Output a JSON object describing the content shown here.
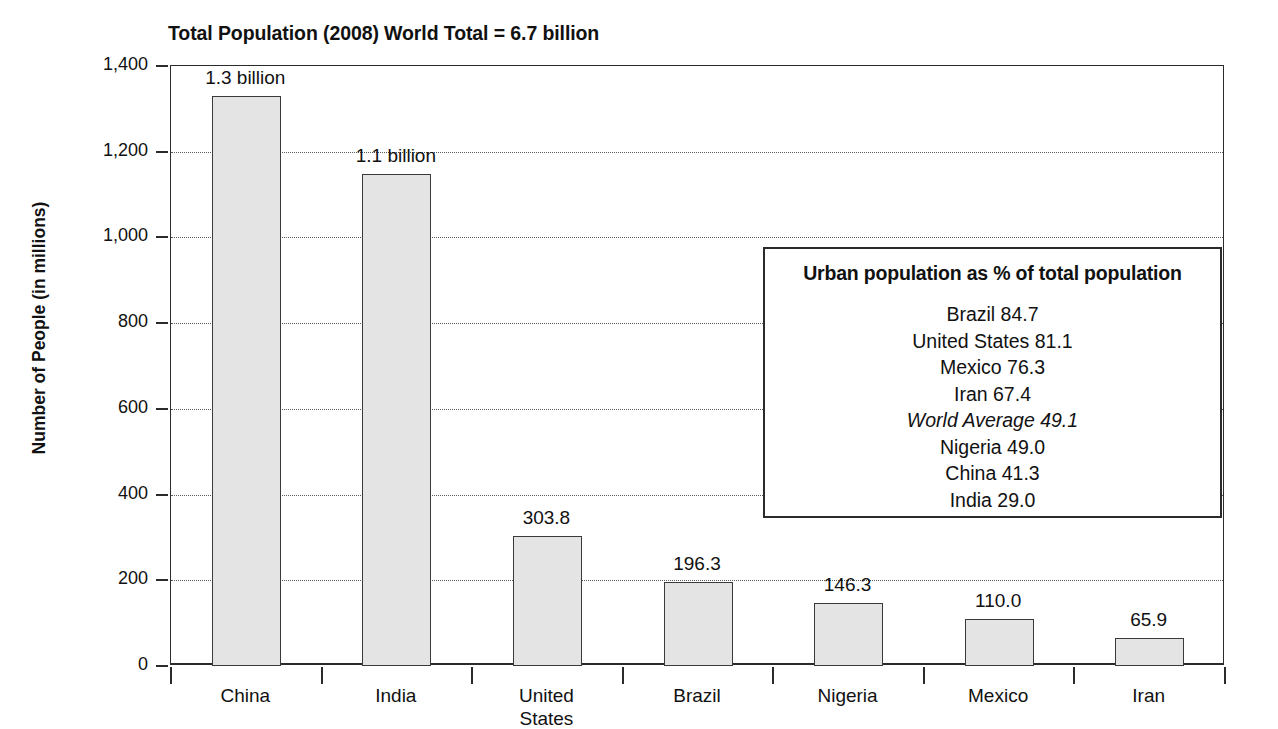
{
  "chart_data": {
    "type": "bar",
    "title": "Total Population (2008) World Total = 6.7 billion",
    "xlabel": "",
    "ylabel": "Number of People (in millions)",
    "ylim": [
      0,
      1400
    ],
    "ytick_values": [
      0,
      200,
      400,
      600,
      800,
      1000,
      1200,
      1400
    ],
    "ytick_labels": [
      "0",
      "200",
      "400",
      "600",
      "800",
      "1,000",
      "1,200",
      "1,400"
    ],
    "grid": "horizontal-dotted",
    "legend": "none",
    "categories": [
      "China",
      "India",
      "United\nStates",
      "Brazil",
      "Nigeria",
      "Mexico",
      "Iran"
    ],
    "values": [
      1330,
      1148,
      303.8,
      196.3,
      146.3,
      110.0,
      65.9
    ],
    "value_labels": [
      "1.3 billion",
      "1.1 billion",
      "303.8",
      "196.3",
      "146.3",
      "110.0",
      "65.9"
    ],
    "bar_fill": "#e4e4e4",
    "bar_edge": "#3a3a3a",
    "annotation": {
      "title": "Urban population as % of total population",
      "rows": [
        {
          "text": "Brazil 84.7",
          "italic": false
        },
        {
          "text": "United States 81.1",
          "italic": false
        },
        {
          "text": "Mexico 76.3",
          "italic": false
        },
        {
          "text": "Iran 67.4",
          "italic": false
        },
        {
          "text": "World Average 49.1",
          "italic": true
        },
        {
          "text": "Nigeria 49.0",
          "italic": false
        },
        {
          "text": "China 41.3",
          "italic": false
        },
        {
          "text": "India 29.0",
          "italic": false
        }
      ]
    }
  }
}
